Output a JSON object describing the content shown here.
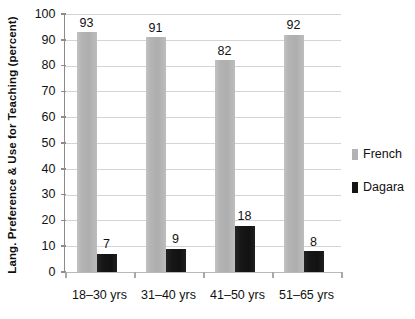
{
  "chart_data": {
    "type": "bar",
    "title": "",
    "subtitle": "",
    "xlabel": "",
    "ylabel": "Lang. Preference & Use for Teaching (percent)",
    "categories": [
      "18–30 yrs",
      "31–40 yrs",
      "41–50 yrs",
      "51–65 yrs"
    ],
    "series": [
      {
        "name": "French",
        "color": "#b3b3b3",
        "values": [
          93,
          91,
          82,
          92
        ],
        "labels": [
          "93",
          "91",
          "82",
          "92"
        ]
      },
      {
        "name": "Dagara",
        "color": "#151515",
        "values": [
          7,
          9,
          18,
          8
        ],
        "labels": [
          "7",
          "9",
          "18",
          "8"
        ]
      }
    ],
    "ylim": [
      0,
      100
    ],
    "y_ticks": [
      0,
      10,
      20,
      30,
      40,
      50,
      60,
      70,
      80,
      90,
      100
    ],
    "y_tick_labels": [
      "0",
      "10",
      "20",
      "30",
      "40",
      "50",
      "60",
      "70",
      "80",
      "90",
      "100"
    ],
    "grid": true,
    "grid_axis": "y",
    "legend_position": "right",
    "legend_entries": [
      "French",
      "Dagara"
    ],
    "data_labels_shown": true,
    "background_color": "#ffffff",
    "grid_color": "#d4d4d4",
    "axis_color": "#8c8c8c"
  }
}
